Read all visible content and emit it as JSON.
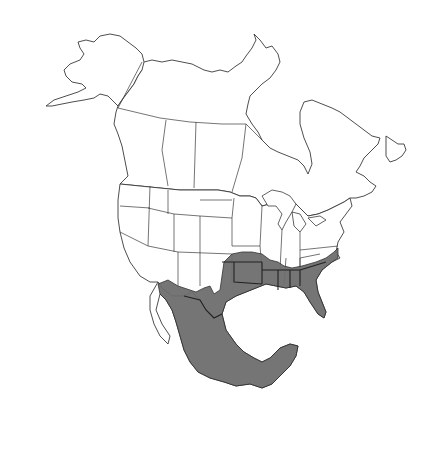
{
  "map": {
    "title": "Range map of North America",
    "region": "North America",
    "style": "black-and-white outline map with shaded range",
    "colors": {
      "background": "#ffffff",
      "outline": "#3a3a3a",
      "range_fill": "#6e6e6e"
    },
    "shaded_range": {
      "description": "Shaded distribution covering southern United States and Mexico",
      "areas": [
        "Southeastern United States",
        "Southern Great Plains",
        "Texas",
        "Southwestern United States (southern portions)",
        "Mexico"
      ]
    },
    "legend": null
  }
}
